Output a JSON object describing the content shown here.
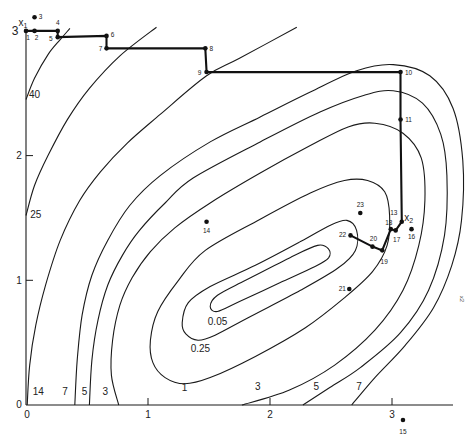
{
  "chart_data": {
    "type": "contour",
    "title": "",
    "xlabel": "",
    "ylabel": "",
    "xlim": [
      0,
      3.5
    ],
    "ylim": [
      0,
      3
    ],
    "grid": false,
    "legend": null,
    "x_ticks": [
      {
        "value": 0,
        "label": "0"
      },
      {
        "value": 1,
        "label": "1"
      },
      {
        "value": 2,
        "label": "2"
      },
      {
        "value": 3,
        "label": "3"
      }
    ],
    "y_ticks": [
      {
        "value": 0,
        "label": "0"
      },
      {
        "value": 1,
        "label": "1"
      },
      {
        "value": 2,
        "label": "2"
      },
      {
        "value": 3,
        "label": "3"
      }
    ],
    "contours": [
      {
        "level": "40",
        "closed": false,
        "points": [
          [
            0,
            2.45
          ],
          [
            0.07,
            2.62
          ],
          [
            0.18,
            2.81
          ],
          [
            0.28,
            2.93
          ],
          [
            0.36,
            3.02
          ]
        ],
        "labels": [
          [
            0.07,
            2.49
          ]
        ]
      },
      {
        "level": "25",
        "closed": false,
        "points": [
          [
            0,
            1.52
          ],
          [
            0.07,
            1.76
          ],
          [
            0.18,
            2.0
          ],
          [
            0.34,
            2.29
          ],
          [
            0.52,
            2.54
          ],
          [
            0.77,
            2.8
          ],
          [
            1.07,
            3.03
          ]
        ],
        "labels": [
          [
            0.08,
            1.53
          ]
        ]
      },
      {
        "level": "14",
        "closed": false,
        "points": [
          [
            0.01,
            0
          ],
          [
            0.03,
            0.32
          ],
          [
            0.08,
            0.64
          ],
          [
            0.16,
            0.96
          ],
          [
            0.28,
            1.32
          ],
          [
            0.44,
            1.64
          ],
          [
            0.61,
            1.87
          ],
          [
            0.83,
            2.1
          ],
          [
            1.1,
            2.33
          ],
          [
            1.48,
            2.64
          ],
          [
            1.75,
            2.78
          ],
          [
            2.22,
            3.03
          ]
        ],
        "labels": [
          [
            0.1,
            0.11
          ]
        ]
      },
      {
        "level": "7",
        "closed": false,
        "points": [
          [
            0.4,
            0
          ],
          [
            0.42,
            0.36
          ],
          [
            0.46,
            0.72
          ],
          [
            0.54,
            1.04
          ],
          [
            0.67,
            1.32
          ],
          [
            0.85,
            1.6
          ],
          [
            1.1,
            1.84
          ],
          [
            1.51,
            2.11
          ],
          [
            1.92,
            2.31
          ],
          [
            2.33,
            2.51
          ],
          [
            2.71,
            2.68
          ],
          [
            3.01,
            2.73
          ],
          [
            3.31,
            2.64
          ],
          [
            3.5,
            2.38
          ],
          [
            3.58,
            1.96
          ],
          [
            3.57,
            1.48
          ],
          [
            3.49,
            1.12
          ],
          [
            3.34,
            0.78
          ],
          [
            3.11,
            0.48
          ],
          [
            2.86,
            0.22
          ],
          [
            2.67,
            0
          ]
        ],
        "labels": [
          [
            0.32,
            0.11
          ],
          [
            2.73,
            0.15
          ]
        ]
      },
      {
        "level": "5",
        "closed": false,
        "points": [
          [
            0.52,
            0
          ],
          [
            0.54,
            0.36
          ],
          [
            0.59,
            0.68
          ],
          [
            0.67,
            0.96
          ],
          [
            0.79,
            1.2
          ],
          [
            0.93,
            1.4
          ],
          [
            1.14,
            1.62
          ],
          [
            1.37,
            1.82
          ],
          [
            1.92,
            2.11
          ],
          [
            2.41,
            2.35
          ],
          [
            2.76,
            2.48
          ],
          [
            3.01,
            2.52
          ],
          [
            3.25,
            2.42
          ],
          [
            3.4,
            2.17
          ],
          [
            3.45,
            1.84
          ],
          [
            3.43,
            1.36
          ],
          [
            3.3,
            0.92
          ],
          [
            3.07,
            0.58
          ],
          [
            2.74,
            0.3
          ],
          [
            2.49,
            0.14
          ],
          [
            2.27,
            0
          ]
        ],
        "labels": [
          [
            0.48,
            0.11
          ],
          [
            2.38,
            0.15
          ]
        ]
      },
      {
        "level": "3",
        "closed": false,
        "points": [
          [
            0.76,
            0
          ],
          [
            0.7,
            0.24
          ],
          [
            0.71,
            0.52
          ],
          [
            0.77,
            0.8
          ],
          [
            0.87,
            1.02
          ],
          [
            1.02,
            1.23
          ],
          [
            1.22,
            1.42
          ],
          [
            1.51,
            1.62
          ],
          [
            1.92,
            1.86
          ],
          [
            2.33,
            2.08
          ],
          [
            2.64,
            2.23
          ],
          [
            2.86,
            2.26
          ],
          [
            3.09,
            2.18
          ],
          [
            3.24,
            1.98
          ],
          [
            3.27,
            1.64
          ],
          [
            3.22,
            1.28
          ],
          [
            3.09,
            0.92
          ],
          [
            2.86,
            0.6
          ],
          [
            2.53,
            0.32
          ],
          [
            2.16,
            0.12
          ],
          [
            1.77,
            0
          ]
        ],
        "labels": [
          [
            0.65,
            0.11
          ],
          [
            1.9,
            0.15
          ]
        ]
      },
      {
        "level": "1",
        "closed": true,
        "points": [
          [
            1.47,
            1.24
          ],
          [
            1.92,
            1.49
          ],
          [
            2.33,
            1.7
          ],
          [
            2.61,
            1.8
          ],
          [
            2.8,
            1.8
          ],
          [
            2.94,
            1.71
          ],
          [
            2.98,
            1.52
          ],
          [
            2.96,
            1.28
          ],
          [
            2.84,
            1.07
          ],
          [
            2.61,
            0.86
          ],
          [
            2.29,
            0.62
          ],
          [
            1.88,
            0.39
          ],
          [
            1.51,
            0.22
          ],
          [
            1.3,
            0.17
          ],
          [
            1.14,
            0.22
          ],
          [
            1.04,
            0.34
          ],
          [
            1.02,
            0.52
          ],
          [
            1.08,
            0.75
          ],
          [
            1.25,
            1.0
          ]
        ],
        "labels": [
          [
            1.3,
            0.14
          ]
        ]
      },
      {
        "level": "0.25",
        "closed": true,
        "points": [
          [
            1.28,
            0.66
          ],
          [
            1.33,
            0.82
          ],
          [
            1.51,
            0.95
          ],
          [
            1.88,
            1.12
          ],
          [
            2.25,
            1.31
          ],
          [
            2.49,
            1.44
          ],
          [
            2.63,
            1.48
          ],
          [
            2.71,
            1.4
          ],
          [
            2.7,
            1.24
          ],
          [
            2.56,
            1.1
          ],
          [
            2.25,
            0.92
          ],
          [
            1.84,
            0.71
          ],
          [
            1.55,
            0.56
          ],
          [
            1.41,
            0.52
          ],
          [
            1.31,
            0.57
          ]
        ],
        "labels": [
          [
            1.43,
            0.45
          ]
        ]
      },
      {
        "level": "0.05",
        "closed": true,
        "points": [
          [
            1.51,
            0.79
          ],
          [
            1.57,
            0.88
          ],
          [
            1.8,
            1.0
          ],
          [
            2.16,
            1.18
          ],
          [
            2.39,
            1.28
          ],
          [
            2.48,
            1.25
          ],
          [
            2.48,
            1.18
          ],
          [
            2.37,
            1.11
          ],
          [
            2.08,
            0.98
          ],
          [
            1.75,
            0.83
          ],
          [
            1.57,
            0.75
          ]
        ],
        "labels": [
          [
            1.57,
            0.67
          ]
        ]
      }
    ],
    "points": [
      {
        "id": "1",
        "x": 0.0,
        "y": 3.0,
        "label_offset": [
          2,
          7
        ]
      },
      {
        "id": "2",
        "x": 0.07,
        "y": 3.0,
        "label_offset": [
          2,
          7
        ]
      },
      {
        "id": "3",
        "x": 0.07,
        "y": 3.11,
        "label_offset": [
          6,
          -1
        ]
      },
      {
        "id": "4",
        "x": 0.26,
        "y": 3.0,
        "label_offset": [
          0,
          -8
        ]
      },
      {
        "id": "5",
        "x": 0.26,
        "y": 2.95,
        "label_offset": [
          -7,
          1
        ]
      },
      {
        "id": "6",
        "x": 0.66,
        "y": 2.96,
        "label_offset": [
          6,
          -1
        ]
      },
      {
        "id": "7",
        "x": 0.66,
        "y": 2.86,
        "label_offset": [
          -6,
          0
        ]
      },
      {
        "id": "8",
        "x": 1.47,
        "y": 2.86,
        "label_offset": [
          6,
          0
        ]
      },
      {
        "id": "9",
        "x": 1.48,
        "y": 2.67,
        "label_offset": [
          -7,
          0
        ]
      },
      {
        "id": "10",
        "x": 3.07,
        "y": 2.67,
        "label_offset": [
          8,
          0
        ]
      },
      {
        "id": "11",
        "x": 3.07,
        "y": 2.29,
        "label_offset": [
          8,
          0
        ]
      },
      {
        "id": "13",
        "x": 3.08,
        "y": 1.47,
        "label_offset": [
          -8,
          -9
        ]
      },
      {
        "id": "14",
        "x": 1.48,
        "y": 1.47,
        "label_offset": [
          0,
          9
        ]
      },
      {
        "id": "15",
        "x": 3.09,
        "y": -0.12,
        "label_offset": [
          0,
          12
        ]
      },
      {
        "id": "16",
        "x": 3.16,
        "y": 1.41,
        "label_offset": [
          0,
          7
        ]
      },
      {
        "id": "17",
        "x": 3.03,
        "y": 1.4,
        "label_offset": [
          1,
          9
        ]
      },
      {
        "id": "18",
        "x": 2.99,
        "y": 1.41,
        "label_offset": [
          -2,
          -7
        ]
      },
      {
        "id": "19",
        "x": 2.92,
        "y": 1.24,
        "label_offset": [
          2,
          11
        ]
      },
      {
        "id": "20",
        "x": 2.84,
        "y": 1.27,
        "label_offset": [
          1,
          -8
        ]
      },
      {
        "id": "21",
        "x": 2.65,
        "y": 0.93,
        "label_offset": [
          -7,
          -1
        ]
      },
      {
        "id": "22",
        "x": 2.66,
        "y": 1.36,
        "label_offset": [
          -8,
          -1
        ]
      },
      {
        "id": "23",
        "x": 2.74,
        "y": 1.54,
        "label_offset": [
          0,
          -8
        ]
      }
    ],
    "search_path": [
      "1",
      "2",
      "4",
      "5",
      "6",
      "7",
      "8",
      "9",
      "10",
      "11",
      "13",
      "17",
      "18",
      "19",
      "20",
      "22"
    ],
    "annotations": [
      {
        "name": "start-label",
        "base": "x",
        "sub": "1",
        "at_point": "1",
        "offset": [
          -3,
          -9
        ]
      },
      {
        "name": "end-label",
        "base": "x",
        "sub": "2",
        "at_point": "13",
        "offset": [
          7,
          -5
        ]
      }
    ],
    "stray_mark": {
      "text": "x2",
      "x": 3.57,
      "y": 0.85
    }
  }
}
